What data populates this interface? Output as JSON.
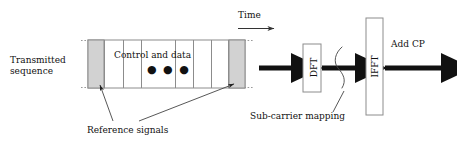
{
  "diagram": {
    "title_text": "SC-FDMA transmitter block diagram",
    "labels": {
      "transmitted_sequence": "Transmitted sequence",
      "control_and_data": "Control and data",
      "ellipsis": "● ● ●",
      "time": "Time",
      "add_cp": "Add CP",
      "reference_signals": "Reference signals",
      "subcarrier_mapping": "Sub-carrier mapping",
      "dft": "DFT",
      "ifft": "IFFT"
    },
    "colors": {
      "reference_block_fill": "#d2d2d2",
      "reference_block_stroke": "#8c8c8c",
      "slot_fill": "#ffffff",
      "slot_stroke": "#8c8c8c",
      "arrow_fill": "#111111",
      "box_stroke": "#8c8c8c",
      "leader_stroke": "#444444",
      "dotted_stroke": "#9a9a9a",
      "background": "#ffffff"
    },
    "geometry": {
      "sequence_block": {
        "x": 88,
        "y": 40,
        "width": 157,
        "height": 48
      },
      "reference_block_left": {
        "x": 88,
        "y": 40,
        "width": 16,
        "height": 48
      },
      "reference_block_right": {
        "x": 229,
        "y": 40,
        "width": 16,
        "height": 48
      },
      "slot_dividers_x": [
        104,
        123,
        141,
        175,
        193,
        211,
        229
      ],
      "dotted_extent": {
        "x1": 81,
        "x2": 254
      },
      "dft_box": {
        "x": 303,
        "y": 44,
        "width": 18,
        "height": 48
      },
      "ifft_box": {
        "x": 366,
        "y": 18,
        "width": 17,
        "height": 97
      },
      "arrows": [
        {
          "name": "input-arrow",
          "x1": 259,
          "x2": 300,
          "y": 68
        },
        {
          "name": "mapping-arrow",
          "x1": 322,
          "x2": 364,
          "y": 68
        },
        {
          "name": "output-arrow",
          "x1": 385,
          "x2": 449,
          "y": 68
        },
        {
          "name": "time-arrow",
          "x1": 238,
          "x2": 275,
          "y": 28
        }
      ],
      "mapping_loop": {
        "cx": 344,
        "cy": 68,
        "rx": 6,
        "ry": 22
      }
    }
  }
}
